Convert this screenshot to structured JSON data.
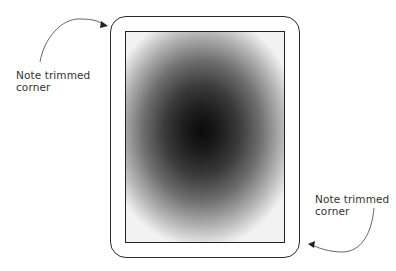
{
  "figure": {
    "annotations": [
      {
        "id": "top-left",
        "line1": "Note trimmed",
        "line2": "corner"
      },
      {
        "id": "bottom-right",
        "line1": "Note trimmed",
        "line2": "corner"
      }
    ],
    "colors": {
      "outline": "#2a2a2a",
      "gradient_center": "#0a0a0a",
      "gradient_edge": "#f2f2f2",
      "text": "#333333"
    }
  }
}
